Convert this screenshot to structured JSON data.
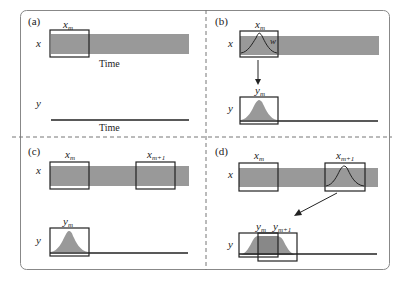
{
  "figure": {
    "colors": {
      "bar": "#999999",
      "stroke": "#222222",
      "border": "#888888",
      "divider": "#777777",
      "background": "#ffffff"
    },
    "panels": [
      {
        "id": "a",
        "label": "(a)",
        "x_axis_label": "x",
        "y_axis_label": "y",
        "x_window_label": "x",
        "x_window_sub": "m",
        "x_time_label": "Time",
        "y_time_label": "Time"
      },
      {
        "id": "b",
        "label": "(b)",
        "x_axis_label": "x",
        "y_axis_label": "y",
        "x_window_label": "x",
        "x_window_sub": "m",
        "window_fn_label": "w",
        "y_window_label": "y",
        "y_window_sub": "m"
      },
      {
        "id": "c",
        "label": "(c)",
        "x_axis_label": "x",
        "y_axis_label": "y",
        "x_window_label": "x",
        "x_window_sub": "m",
        "x_window2_label": "x",
        "x_window2_sub": "m+1",
        "y_window_label": "y",
        "y_window_sub": "m"
      },
      {
        "id": "d",
        "label": "(d)",
        "x_axis_label": "x",
        "y_axis_label": "y",
        "x_window_label": "x",
        "x_window_sub": "m",
        "x_window2_label": "x",
        "x_window2_sub": "m+1",
        "y_window_label": "y",
        "y_window_sub": "m",
        "y_window2_label": "y",
        "y_window2_sub": "m+1"
      }
    ]
  }
}
